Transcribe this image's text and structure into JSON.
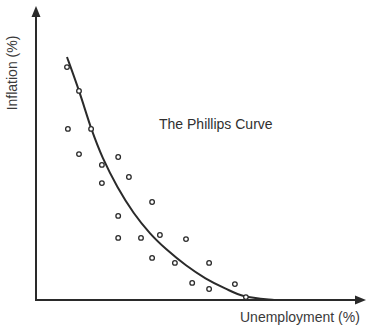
{
  "chart_data": {
    "type": "scatter",
    "title": "The Phillips Curve",
    "xlabel": "Unemployment (%)",
    "ylabel": "Inflation (%)",
    "xlim": [
      0,
      100
    ],
    "ylim": [
      0,
      100
    ],
    "grid": false,
    "legend": null,
    "ticks": "none shown (axes have arrowheads, no tick labels)",
    "series": [
      {
        "name": "observations",
        "kind": "scatter",
        "marker": "open-circle",
        "points": [
          {
            "x": 9.5,
            "y": 80.3
          },
          {
            "x": 13.2,
            "y": 72.1
          },
          {
            "x": 9.8,
            "y": 59.0
          },
          {
            "x": 16.9,
            "y": 59.0
          },
          {
            "x": 13.2,
            "y": 50.3
          },
          {
            "x": 20.2,
            "y": 46.6
          },
          {
            "x": 25.2,
            "y": 49.3
          },
          {
            "x": 28.5,
            "y": 42.4
          },
          {
            "x": 20.2,
            "y": 40.3
          },
          {
            "x": 35.6,
            "y": 33.8
          },
          {
            "x": 25.2,
            "y": 29.0
          },
          {
            "x": 25.2,
            "y": 21.4
          },
          {
            "x": 32.2,
            "y": 21.4
          },
          {
            "x": 38.0,
            "y": 22.4
          },
          {
            "x": 46.0,
            "y": 21.0
          },
          {
            "x": 35.6,
            "y": 14.5
          },
          {
            "x": 42.6,
            "y": 12.8
          },
          {
            "x": 53.1,
            "y": 12.8
          },
          {
            "x": 47.9,
            "y": 5.9
          },
          {
            "x": 53.1,
            "y": 3.8
          },
          {
            "x": 61.0,
            "y": 5.5
          },
          {
            "x": 64.4,
            "y": 1.0
          }
        ]
      },
      {
        "name": "Phillips curve (fitted)",
        "kind": "line",
        "points": [
          {
            "x": 9.5,
            "y": 83.8
          },
          {
            "x": 13.2,
            "y": 72.1
          },
          {
            "x": 17.0,
            "y": 59.0
          },
          {
            "x": 20.5,
            "y": 49.0
          },
          {
            "x": 25.0,
            "y": 39.0
          },
          {
            "x": 30.0,
            "y": 30.0
          },
          {
            "x": 35.0,
            "y": 23.0
          },
          {
            "x": 40.0,
            "y": 17.5
          },
          {
            "x": 46.0,
            "y": 12.0
          },
          {
            "x": 52.0,
            "y": 7.5
          },
          {
            "x": 58.0,
            "y": 4.0
          },
          {
            "x": 64.0,
            "y": 1.3
          },
          {
            "x": 73.0,
            "y": 0.0
          }
        ]
      }
    ]
  },
  "labels": {
    "title": "The Phillips Curve",
    "xlabel": "Unemployment (%)",
    "ylabel": "Inflation (%)"
  },
  "colors": {
    "ink": "#2a2a2a",
    "background": "#ffffff"
  }
}
